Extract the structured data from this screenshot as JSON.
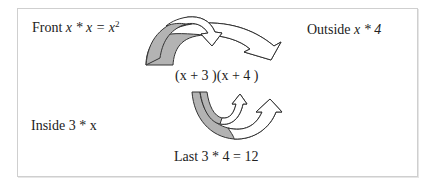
{
  "diagram": {
    "expression": "(x + 3 )(x + 4 )",
    "labels": {
      "front": {
        "word": "Front",
        "expr": "x * x = x",
        "power": "2"
      },
      "outside": {
        "word": "Outside",
        "expr": "x * 4"
      },
      "inside": {
        "word": "Inside",
        "expr": "3 * x"
      },
      "last": {
        "word": "Last",
        "expr": "3 * 4 = 12"
      }
    },
    "colors": {
      "arrow_fill_shaded": "#b3b3b3",
      "arrow_fill_open": "#ffffff",
      "arrow_stroke": "#333333",
      "frame_border": "#cfcfcf"
    }
  }
}
